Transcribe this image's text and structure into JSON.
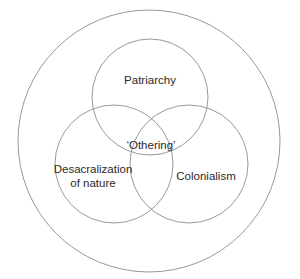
{
  "diagram": {
    "type": "venn",
    "outer_circle": {
      "cx": 149,
      "cy": 141,
      "r": 131
    },
    "sets": [
      {
        "label": "Patriarchy",
        "cx": 150,
        "cy": 97,
        "r": 58,
        "label_x": 150,
        "label_y": 80
      },
      {
        "label_line1": "Desacralization",
        "label_line2": "of nature",
        "cx": 114,
        "cy": 164,
        "r": 59,
        "label_x": 93,
        "label_y": 176
      },
      {
        "label": "Colonialism",
        "cx": 189,
        "cy": 164,
        "r": 59,
        "label_x": 206,
        "label_y": 176
      }
    ],
    "center_label": {
      "text": "‘Othering’",
      "x": 151,
      "y": 145
    },
    "stroke_color": "#8c8c8c",
    "text_color": "#2a2a2a",
    "background": "#ffffff"
  }
}
